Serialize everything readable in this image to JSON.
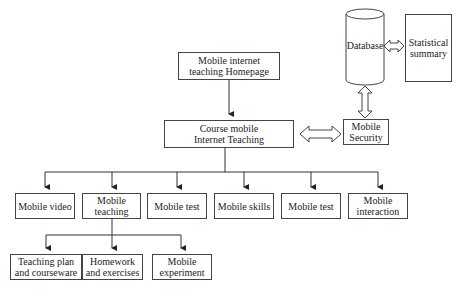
{
  "diagram": {
    "homepage": "Mobile internet teaching Homepage",
    "course": "Course mobile Internet Teaching",
    "database": "Database",
    "statistical_summary": "Statistical summary",
    "mobile_security": "Mobile Security",
    "modules": [
      "Mobile video",
      "Mobile teaching",
      "Mobile test",
      "Mobile skills",
      "Mobile test",
      "Mobile interaction"
    ],
    "teaching_submodules": [
      "Teaching plan and courseware",
      "Homework and exercises",
      "Mobile experiment"
    ]
  }
}
